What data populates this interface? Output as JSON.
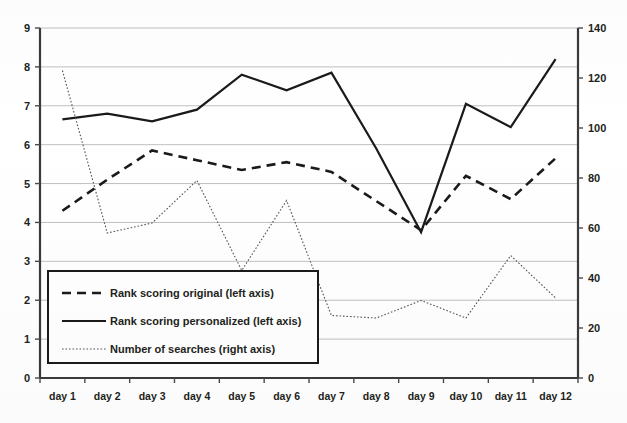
{
  "chart_data": {
    "type": "line",
    "title": "",
    "xlabel": "",
    "ylabel": "",
    "grid": true,
    "legend_position": "inside-bottom-left",
    "categories": [
      "day 1",
      "day 2",
      "day 3",
      "day 4",
      "day 5",
      "day 6",
      "day 7",
      "day 8",
      "day 9",
      "day 10",
      "day 11",
      "day 12"
    ],
    "axes": {
      "left": {
        "label": "",
        "ylim": [
          0,
          9
        ],
        "ticks": [
          0,
          1,
          2,
          3,
          4,
          5,
          6,
          7,
          8,
          9
        ],
        "tick_labels": [
          "0",
          "1",
          "2",
          "3",
          "4",
          "5",
          "6",
          "7",
          "8",
          "9"
        ]
      },
      "right": {
        "label": "",
        "ylim": [
          0,
          140
        ],
        "ticks": [
          0,
          20,
          40,
          60,
          80,
          100,
          120,
          140
        ],
        "tick_labels": [
          "0",
          "20",
          "40",
          "60",
          "80",
          "100",
          "120",
          "140"
        ]
      }
    },
    "series": [
      {
        "name": "Rank scoring original (left axis)",
        "axis": "left",
        "style": "dashed",
        "color": "#1a1a1a",
        "values": [
          4.3,
          5.1,
          5.85,
          5.6,
          5.35,
          5.55,
          5.3,
          4.55,
          3.8,
          5.2,
          4.6,
          5.65
        ]
      },
      {
        "name": "Rank scoring personalized (left axis)",
        "axis": "left",
        "style": "solid",
        "color": "#1a1a1a",
        "values": [
          6.65,
          6.8,
          6.6,
          6.9,
          7.8,
          7.4,
          7.85,
          5.9,
          3.75,
          7.05,
          6.45,
          8.2
        ]
      },
      {
        "name": "Number of searches (right axis)",
        "axis": "right",
        "style": "dotted",
        "color": "#555555",
        "values": [
          123,
          58,
          62,
          79,
          43,
          71,
          25,
          24,
          31,
          24,
          49,
          32
        ]
      }
    ]
  },
  "legend": {
    "items": [
      {
        "label": "Rank scoring original (left axis)",
        "style": "dashed"
      },
      {
        "label": "Rank scoring personalized (left axis)",
        "style": "solid"
      },
      {
        "label": "Number of searches (right axis)",
        "style": "dotted"
      }
    ]
  }
}
